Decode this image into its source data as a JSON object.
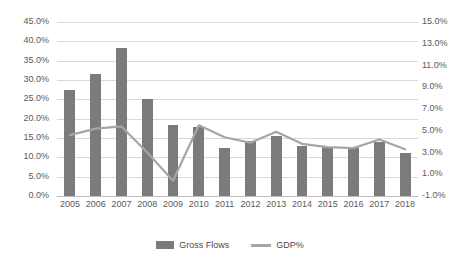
{
  "chart_data": {
    "type": "bar",
    "title": "",
    "xlabel": "",
    "ylabel": "",
    "grid": true,
    "legend_position": "bottom",
    "categories": [
      "2005",
      "2006",
      "2007",
      "2008",
      "2009",
      "2010",
      "2011",
      "2012",
      "2013",
      "2014",
      "2015",
      "2016",
      "2017",
      "2018"
    ],
    "series": [
      {
        "name": "Gross Flows",
        "type": "bar",
        "axis": "left",
        "color": "#7b7b7b",
        "values": [
          27.4,
          31.6,
          38.4,
          25.0,
          18.3,
          17.8,
          12.3,
          14.3,
          15.4,
          12.9,
          12.6,
          12.5,
          13.9,
          11.1
        ]
      },
      {
        "name": "GDP%",
        "type": "line",
        "axis": "right",
        "color": "#a6a6a6",
        "values": [
          4.6,
          5.2,
          5.4,
          3.0,
          0.4,
          5.5,
          4.4,
          3.9,
          4.9,
          3.8,
          3.5,
          3.4,
          4.2,
          3.3
        ]
      }
    ],
    "axes": {
      "left": {
        "min": 0.0,
        "max": 45.0,
        "step": 5.0,
        "ticks": [
          "0.0%",
          "5.0%",
          "10.0%",
          "15.0%",
          "20.0%",
          "25.0%",
          "30.0%",
          "35.0%",
          "40.0%",
          "45.0%"
        ]
      },
      "right": {
        "min": -1.0,
        "max": 15.0,
        "step": 2.0,
        "ticks": [
          "-1.0%",
          "1.0%",
          "3.0%",
          "5.0%",
          "7.0%",
          "9.0%",
          "11.0%",
          "13.0%",
          "15.0%"
        ]
      }
    }
  },
  "legend": {
    "items": [
      {
        "label": "Gross Flows",
        "marker": "bar-swatch"
      },
      {
        "label": "GDP%",
        "marker": "line-swatch"
      }
    ]
  }
}
